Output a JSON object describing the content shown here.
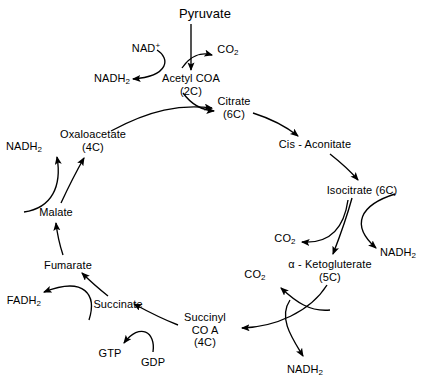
{
  "diagram": {
    "type": "cycle-flow-diagram",
    "background_color": "#ffffff",
    "stroke_color": "#000000"
  },
  "nodes": {
    "pyruvate": {
      "label": "Pyruvate",
      "carbons": "",
      "x": 205,
      "y": 14
    },
    "nad_plus": {
      "label": "NAD",
      "charge": "+",
      "x": 146,
      "y": 47
    },
    "co2_top": {
      "label": "CO",
      "sub": "2",
      "x": 228,
      "y": 51
    },
    "nadh2_top": {
      "label": "NADH",
      "sub": "2",
      "x": 112,
      "y": 80
    },
    "acetyl_coa": {
      "label": "Acetyl COA",
      "carbons": "(2C)",
      "x": 191,
      "y": 84
    },
    "citrate": {
      "label": "Citrate",
      "carbons": "(6C)",
      "x": 234,
      "y": 107
    },
    "cis_aconitate": {
      "label": "Cis - Aconitate",
      "carbons": "",
      "x": 315,
      "y": 144
    },
    "isocitrate": {
      "label": "Isocitrate (6C)",
      "carbons": "",
      "x": 362,
      "y": 190
    },
    "nadh2_right": {
      "label": "NADH",
      "sub": "2",
      "x": 398,
      "y": 254
    },
    "co2_right": {
      "label": "CO",
      "sub": "2",
      "x": 285,
      "y": 240
    },
    "alpha_kg": {
      "label": "α - Ketogluterate",
      "carbons": "(5C)",
      "x": 330,
      "y": 270
    },
    "co2_bottom": {
      "label": "CO",
      "sub": "2",
      "x": 255,
      "y": 276
    },
    "nadh2_bottom": {
      "label": "NADH",
      "sub": "2",
      "x": 305,
      "y": 371
    },
    "succinyl_coa": {
      "label": "Succinyl",
      "line2": "CO A",
      "carbons": "(4C)",
      "x": 205,
      "y": 330
    },
    "gdp": {
      "label": "GDP",
      "carbons": "",
      "x": 153,
      "y": 362
    },
    "gtp": {
      "label": "GTP",
      "carbons": "",
      "x": 110,
      "y": 353
    },
    "succinate": {
      "label": "Succinate",
      "carbons": "",
      "x": 118,
      "y": 304
    },
    "fadh2": {
      "label": "FADH",
      "sub": "2",
      "x": 24,
      "y": 302
    },
    "fumarate": {
      "label": "Fumarate",
      "carbons": "",
      "x": 68,
      "y": 265
    },
    "malate": {
      "label": "Malate",
      "carbons": "",
      "x": 56,
      "y": 212
    },
    "nadh2_left": {
      "label": "NADH",
      "sub": "2",
      "x": 24,
      "y": 148
    },
    "oxaloacetate": {
      "label": "Oxaloacetate",
      "carbons": "(4C)",
      "x": 93,
      "y": 140
    }
  },
  "cycle_order": [
    "Citrate (6C)",
    "Cis - Aconitate",
    "Isocitrate (6C)",
    "α - Ketogluterate (5C)",
    "Succinyl CO A (4C)",
    "Succinate",
    "Fumarate",
    "Malate",
    "Oxaloacetate (4C)"
  ],
  "inputs": [
    "Pyruvate",
    "NAD+",
    "GDP"
  ],
  "outputs": [
    "CO2",
    "NADH2",
    "GTP",
    "FADH2"
  ]
}
